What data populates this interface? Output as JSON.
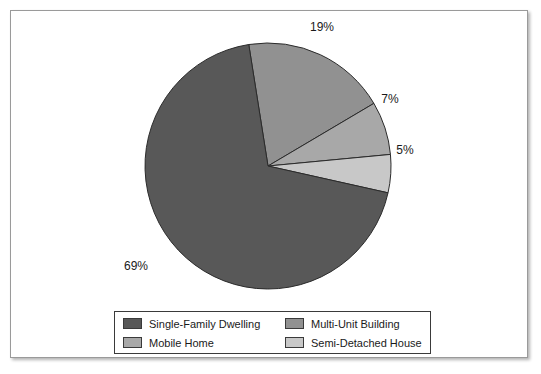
{
  "chart_data": {
    "type": "pie",
    "title": "",
    "categories": [
      "Single-Family Dwelling",
      "Multi-Unit Building",
      "Mobile Home",
      "Semi-Detached House"
    ],
    "values": [
      69,
      19,
      7,
      5
    ],
    "value_unit": "%",
    "data_labels": [
      "69%",
      "19%",
      "7%",
      "5%"
    ],
    "colors": [
      "#585858",
      "#919191",
      "#a8a8a8",
      "#c8c8c8"
    ],
    "slice_order_clockwise": [
      "Multi-Unit Building",
      "Mobile Home",
      "Semi-Detached House",
      "Single-Family Dwelling"
    ],
    "start_angle_deg": -9,
    "direction": "clockwise",
    "legend_position": "bottom",
    "legend_columns": 2,
    "grid": false,
    "xlabel": "",
    "ylabel": ""
  },
  "slices": [
    {
      "key": "multi-unit-building",
      "label": "Multi-Unit Building",
      "percent": 19,
      "data_label": "19%",
      "color": "#919191",
      "label_x": 311,
      "label_y": 20
    },
    {
      "key": "mobile-home",
      "label": "Mobile Home",
      "percent": 7,
      "data_label": "7%",
      "color": "#a8a8a8",
      "label_x": 379,
      "label_y": 92
    },
    {
      "key": "semi-detached-house",
      "label": "Semi-Detached House",
      "percent": 5,
      "data_label": "5%",
      "color": "#c8c8c8",
      "label_x": 394,
      "label_y": 143
    },
    {
      "key": "single-family-dwelling",
      "label": "Single-Family Dwelling",
      "percent": 69,
      "data_label": "69%",
      "color": "#585858",
      "label_x": 125,
      "label_y": 259
    }
  ],
  "legend": {
    "entries": [
      {
        "key": "single-family-dwelling",
        "label": "Single-Family Dwelling",
        "color": "#585858"
      },
      {
        "key": "multi-unit-building",
        "label": "Multi-Unit Building",
        "color": "#919191"
      },
      {
        "key": "mobile-home",
        "label": "Mobile Home",
        "color": "#a8a8a8"
      },
      {
        "key": "semi-detached-house",
        "label": "Semi-Detached House",
        "color": "#c8c8c8"
      }
    ]
  },
  "geometry": {
    "center_x": 257,
    "center_y": 155,
    "radius": 123
  }
}
